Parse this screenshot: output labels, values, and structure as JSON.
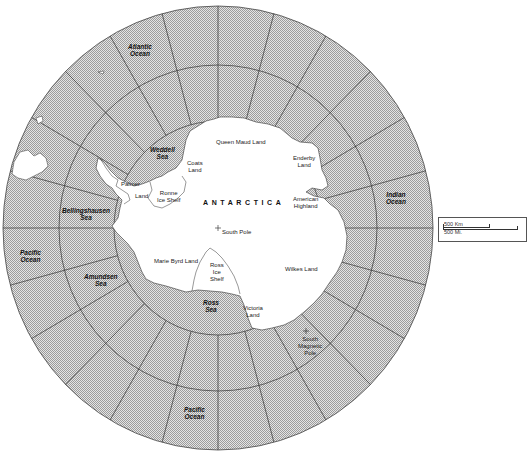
{
  "map": {
    "title": "Antarctica",
    "continent_label": "ANTARCTICA",
    "colors": {
      "ocean_hatch": "#9a9a9a",
      "ocean_bg": "#e2e2e2",
      "land": "#ffffff",
      "grid_line": "#333333"
    },
    "oceans_and_seas": [
      {
        "id": "atlantic-ocean",
        "label": "Atlantic\nOcean",
        "x": 132,
        "y": 43
      },
      {
        "id": "weddell-sea",
        "label": "Weddell\nSea",
        "x": 148,
        "y": 148
      },
      {
        "id": "bellingshausen-sea",
        "label": "Bellingshausen\nSea",
        "x": 62,
        "y": 209
      },
      {
        "id": "pacific-ocean-west",
        "label": "Pacific\nOcean",
        "x": 22,
        "y": 250
      },
      {
        "id": "amundsen-sea",
        "label": "Amundsen\nSea",
        "x": 86,
        "y": 274
      },
      {
        "id": "ross-sea",
        "label": "Ross\nSea",
        "x": 205,
        "y": 300
      },
      {
        "id": "pacific-ocean-south",
        "label": "Pacific\nOcean",
        "x": 186,
        "y": 404
      },
      {
        "id": "indian-ocean",
        "label": "Indian\nOcean",
        "x": 385,
        "y": 191
      }
    ],
    "regions": [
      {
        "id": "queen-maud-land",
        "label": "Queen Maud Land",
        "x": 216,
        "y": 140
      },
      {
        "id": "coats-land",
        "label": "Coats\nLand",
        "x": 189,
        "y": 160
      },
      {
        "id": "enderby-land",
        "label": "Enderby\nLand",
        "x": 296,
        "y": 156
      },
      {
        "id": "palmer-land-1",
        "label": "Palmer",
        "x": 122,
        "y": 181
      },
      {
        "id": "palmer-land-2",
        "label": "Land",
        "x": 136,
        "y": 193
      },
      {
        "id": "ronne-ice-shelf",
        "label": "Ronne\nIce Shelf",
        "x": 159,
        "y": 190
      },
      {
        "id": "american-highland",
        "label": "American\nHighland",
        "x": 295,
        "y": 197
      },
      {
        "id": "south-pole",
        "label": "South Pole",
        "x": 220,
        "y": 228
      },
      {
        "id": "marie-byrd-land",
        "label": "Marie Byrd Land",
        "x": 154,
        "y": 259
      },
      {
        "id": "ross-ice-shelf",
        "label": "Ross\nIce\nShelf",
        "x": 212,
        "y": 262
      },
      {
        "id": "wilkes-land",
        "label": "Wilkes Land",
        "x": 287,
        "y": 266
      },
      {
        "id": "victoria-land",
        "label": "Victoria\nLand",
        "x": 245,
        "y": 306
      },
      {
        "id": "south-magnetic-pole",
        "label": "South\nMagnetic\nPole",
        "x": 305,
        "y": 336
      }
    ],
    "scale": {
      "km_label": "500 Km",
      "mi_label": "500 Mi."
    }
  }
}
